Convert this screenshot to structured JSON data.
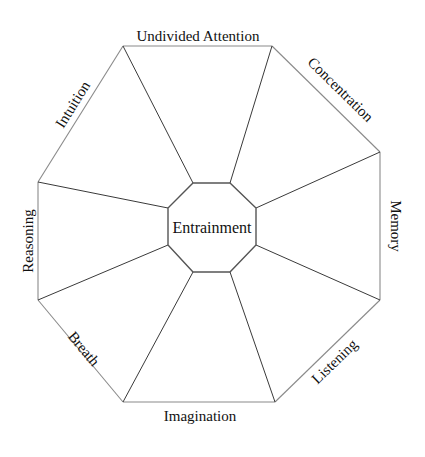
{
  "diagram": {
    "center": {
      "label": "Entrainment"
    },
    "segments": [
      {
        "id": "top",
        "label": "Undivided Attention"
      },
      {
        "id": "top-right",
        "label": "Concentration"
      },
      {
        "id": "right",
        "label": "Memory"
      },
      {
        "id": "bottom-right",
        "label": "Listening"
      },
      {
        "id": "bottom",
        "label": "Imagination"
      },
      {
        "id": "bottom-left",
        "label": "Breath"
      },
      {
        "id": "left",
        "label": "Reasoning"
      },
      {
        "id": "top-left",
        "label": "Intuition"
      }
    ],
    "colors": {
      "outer_edge": "#8a8a8a",
      "spoke": "#3a3a3a",
      "inner_octagon": "#555555",
      "text": "#111111",
      "background": "#ffffff"
    }
  }
}
